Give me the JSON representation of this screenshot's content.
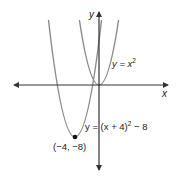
{
  "diagram": {
    "type": "function-graph",
    "axes": {
      "x_label": "x",
      "y_label": "y",
      "arrows": [
        "left",
        "right",
        "up",
        "down"
      ],
      "color": "#333333"
    },
    "curves": [
      {
        "name": "parent",
        "equation_lhs": "y = x",
        "equation_exp": "2",
        "equation_tail": "",
        "vertex": [
          0,
          0
        ],
        "color": "#8a8a8a"
      },
      {
        "name": "translated",
        "equation_lhs": "y = (x + 4)",
        "equation_exp": "2",
        "equation_tail": " − 8",
        "vertex": [
          -4,
          -8
        ],
        "color": "#8a8a8a"
      }
    ],
    "points": [
      {
        "label": "(−4, −8)",
        "x": -4,
        "y": -8,
        "color": "#111111"
      }
    ]
  }
}
